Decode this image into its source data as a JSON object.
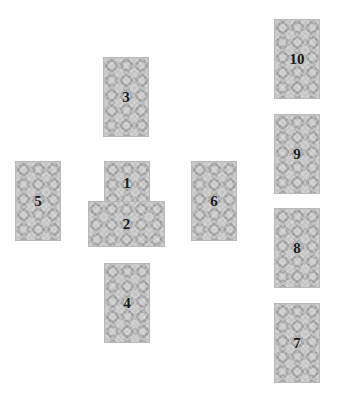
{
  "layout": {
    "name": "Celtic Cross spread",
    "background": "#ffffff",
    "card_back_color": "#a9a9a9",
    "number_color": "#1a1a1a"
  },
  "watermark": "",
  "cards": [
    {
      "position": 1,
      "label": "1",
      "orientation": "vertical",
      "x": 104,
      "y": 161
    },
    {
      "position": 2,
      "label": "2",
      "orientation": "horizontal",
      "x": 88,
      "y": 201
    },
    {
      "position": 3,
      "label": "3",
      "orientation": "vertical",
      "x": 103,
      "y": 57
    },
    {
      "position": 4,
      "label": "4",
      "orientation": "vertical",
      "x": 104,
      "y": 263
    },
    {
      "position": 5,
      "label": "5",
      "orientation": "vertical",
      "x": 15,
      "y": 161
    },
    {
      "position": 6,
      "label": "6",
      "orientation": "vertical",
      "x": 191,
      "y": 161
    },
    {
      "position": 7,
      "label": "7",
      "orientation": "vertical",
      "x": 274,
      "y": 303
    },
    {
      "position": 8,
      "label": "8",
      "orientation": "vertical",
      "x": 274,
      "y": 208
    },
    {
      "position": 9,
      "label": "9",
      "orientation": "vertical",
      "x": 274,
      "y": 114
    },
    {
      "position": 10,
      "label": "10",
      "orientation": "vertical",
      "x": 274,
      "y": 19
    }
  ]
}
